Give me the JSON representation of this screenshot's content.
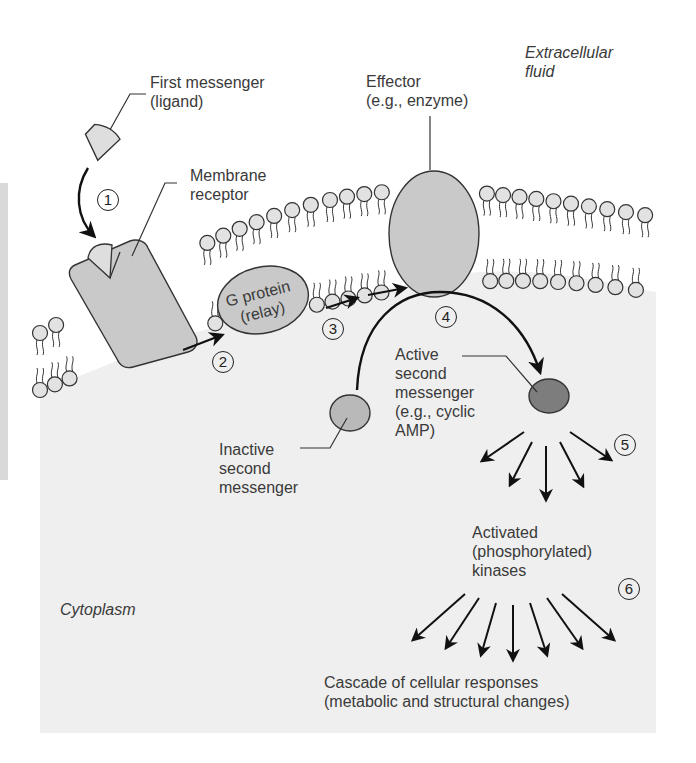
{
  "figure": {
    "regions": {
      "extracellular": "Extracellular\nfluid",
      "cytoplasm": "Cytoplasm"
    },
    "labels": {
      "first_messenger": "First messenger\n(ligand)",
      "membrane_receptor": "Membrane\nreceptor",
      "effector": "Effector\n(e.g., enzyme)",
      "g_protein": "G protein\n(relay)",
      "active_second_messenger": "Active\nsecond\nmessenger\n(e.g., cyclic\nAMP)",
      "inactive_second_messenger": "Inactive\nsecond\nmessenger",
      "activated_kinases": "Activated\n(phosphorylated)\nkinases",
      "cascade": "Cascade of cellular responses\n(metabolic and structural changes)"
    },
    "steps": [
      "1",
      "2",
      "3",
      "4",
      "5",
      "6"
    ],
    "colors": {
      "cytoplasm": "#efefef",
      "protein_fill": "#c9c9c9",
      "ligand_fill": "#dedede",
      "head_fill": "#e2e2e2",
      "active_messenger": "#7d7d7d",
      "inactive_messenger": "#b9b9b9",
      "outline": "#333333"
    }
  }
}
